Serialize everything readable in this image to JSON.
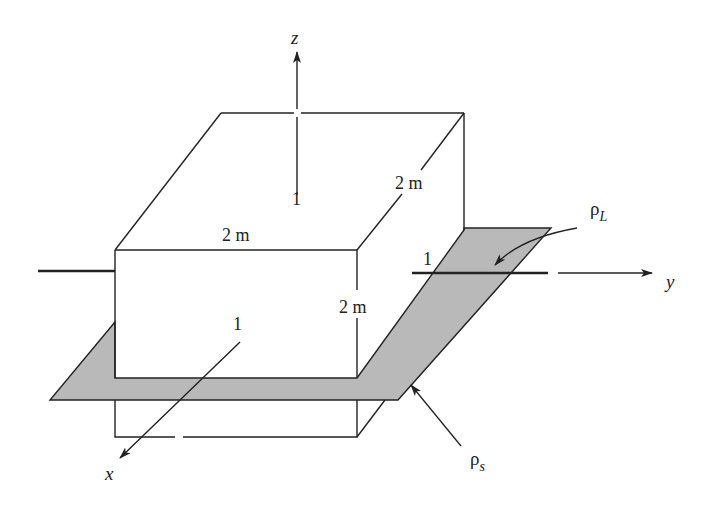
{
  "diagram": {
    "type": "3d-geometry",
    "colors": {
      "stroke": "#222222",
      "plane_fill": "#b9b9b9",
      "background": "#ffffff"
    },
    "axes": {
      "x": {
        "label": "x"
      },
      "y": {
        "label": "y"
      },
      "z": {
        "label": "z"
      }
    },
    "box": {
      "width_label": "2 m",
      "depth_label": "2 m",
      "height_label": "2 m"
    },
    "axis_marks": {
      "x_mark": "1",
      "y_mark": "1",
      "z_mark": "1"
    },
    "charges": {
      "line_charge": {
        "symbol": "ρ",
        "subscript": "L"
      },
      "surface_charge": {
        "symbol": "ρ",
        "subscript": "s"
      }
    }
  }
}
